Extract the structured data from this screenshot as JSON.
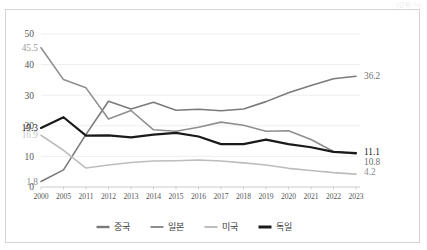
{
  "unit_note": "(단위: %)",
  "chart_data": {
    "type": "line",
    "title": "",
    "subtitle": "",
    "xlabel": "",
    "ylabel": "",
    "ylim": [
      0,
      50
    ],
    "yticks": [
      0,
      10,
      20,
      30,
      40,
      50
    ],
    "grid": true,
    "legend_position": "bottom",
    "categories": [
      "2000",
      "2005",
      "2011",
      "2012",
      "2013",
      "2014",
      "2015",
      "2016",
      "2017",
      "2018",
      "2019",
      "2020",
      "2021",
      "2022",
      "2023"
    ],
    "series": [
      {
        "name": "중국",
        "color": "#7a7a7a",
        "width": 1.6,
        "values": [
          1.8,
          5.6,
          17.2,
          28.0,
          25.5,
          27.7,
          25.1,
          25.4,
          24.9,
          25.5,
          27.9,
          30.8,
          33.2,
          35.4,
          36.2
        ],
        "start_label": "1.8",
        "end_label": "36.2"
      },
      {
        "name": "일본",
        "color": "#8f8f8f",
        "width": 1.6,
        "values": [
          45.5,
          35.1,
          32.4,
          22.2,
          25.0,
          18.7,
          18.2,
          19.5,
          21.2,
          20.2,
          18.2,
          18.4,
          15.5,
          11.6,
          10.8
        ],
        "start_label": "45.5",
        "end_label": "10.8"
      },
      {
        "name": "미국",
        "color": "#bdbdbd",
        "width": 1.6,
        "values": [
          16.9,
          12.0,
          6.2,
          7.2,
          8.0,
          8.5,
          8.6,
          8.8,
          8.5,
          7.9,
          7.2,
          6.1,
          5.4,
          4.7,
          4.2
        ],
        "start_label": "16.9",
        "end_label": "4.2"
      },
      {
        "name": "독일",
        "color": "#1a1a1a",
        "width": 2.2,
        "values": [
          19.3,
          22.8,
          16.8,
          16.9,
          16.2,
          17.1,
          17.7,
          16.5,
          14.0,
          14.0,
          15.5,
          14.0,
          13.0,
          11.5,
          11.1
        ],
        "start_label": "19.3",
        "end_label": "11.1"
      }
    ],
    "start_labels": [
      {
        "text": "45.5",
        "series": "일본",
        "color": "#9a9a9a"
      },
      {
        "text": "19.3",
        "series": "독일",
        "color": "#1a1a1a"
      },
      {
        "text": "16.9",
        "series": "미국",
        "color": "#c8c8c8"
      },
      {
        "text": "1.8",
        "series": "중국",
        "color": "#8a8a8a"
      }
    ],
    "end_labels": [
      {
        "text": "36.2",
        "series": "중국",
        "color": "#6f6f6f"
      },
      {
        "text": "11.1",
        "series": "독일",
        "color": "#1a1a1a"
      },
      {
        "text": "10.8",
        "series": "일본",
        "color": "#6f6f6f"
      },
      {
        "text": "4.2",
        "series": "미국",
        "color": "#8a8a8a"
      }
    ],
    "legend": [
      {
        "label": "중국",
        "color": "#7a7a7a",
        "width": 2.4
      },
      {
        "label": "일본",
        "color": "#8f8f8f",
        "width": 2.0
      },
      {
        "label": "미국",
        "color": "#bdbdbd",
        "width": 2.0
      },
      {
        "label": "독일",
        "color": "#1a1a1a",
        "width": 3.0
      }
    ]
  }
}
